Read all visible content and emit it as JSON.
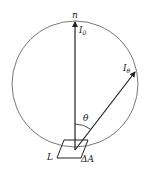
{
  "diagram": {
    "labels": {
      "normal": "n",
      "normal_intensity": "I",
      "normal_intensity_sub": "0",
      "angle_intensity": "I",
      "angle_intensity_sub": "θ",
      "angle": "θ",
      "surface": "L",
      "area": "ΔA"
    },
    "colors": {
      "stroke": "#222222",
      "circle": "#555555",
      "background": "#ffffff"
    }
  }
}
